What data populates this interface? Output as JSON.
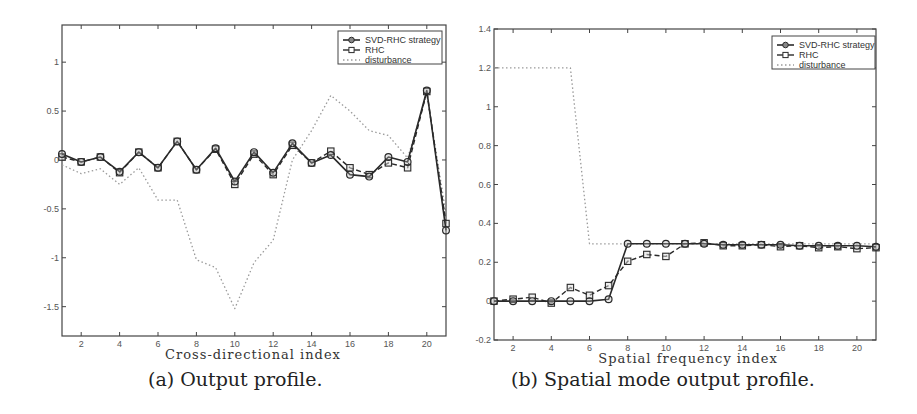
{
  "chart_data": [
    {
      "type": "line",
      "caption": "(a) Output profile.",
      "title": "",
      "xlabel": "Cross-directional index",
      "ylabel": "",
      "xlim": [
        1,
        21
      ],
      "ylim": [
        -1.8,
        1.38
      ],
      "xticks": [
        2,
        4,
        6,
        8,
        10,
        12,
        14,
        16,
        18,
        20
      ],
      "yticks": [
        -1.5,
        -1,
        -0.5,
        0,
        0.5,
        1
      ],
      "ytick_labels": [
        "-1.5",
        "-1",
        "-0.5",
        "0",
        "0.5",
        "1"
      ],
      "grid": false,
      "legend_position": "upper right",
      "x": [
        1,
        2,
        3,
        4,
        5,
        6,
        7,
        8,
        9,
        10,
        11,
        12,
        13,
        14,
        15,
        16,
        17,
        18,
        19,
        20,
        21
      ],
      "series": [
        {
          "name": "SVD-RHC strategy",
          "style": "solid-circle",
          "values": [
            0.06,
            -0.02,
            0.03,
            -0.12,
            0.08,
            -0.08,
            0.19,
            -0.1,
            0.12,
            -0.22,
            0.08,
            -0.13,
            0.17,
            -0.03,
            0.05,
            -0.15,
            -0.17,
            0.03,
            -0.02,
            0.71,
            -0.72
          ]
        },
        {
          "name": "RHC",
          "style": "dashed-square",
          "values": [
            0.03,
            -0.02,
            0.03,
            -0.13,
            0.08,
            -0.08,
            0.19,
            -0.1,
            0.11,
            -0.25,
            0.06,
            -0.15,
            0.15,
            -0.03,
            0.09,
            -0.08,
            -0.15,
            -0.03,
            -0.08,
            0.7,
            -0.65
          ]
        },
        {
          "name": "disturbance",
          "style": "dotted",
          "values": [
            -0.05,
            -0.14,
            -0.09,
            -0.25,
            -0.08,
            -0.41,
            -0.41,
            -1.02,
            -1.1,
            -1.52,
            -1.05,
            -0.82,
            0.0,
            0.3,
            0.66,
            0.5,
            0.3,
            0.25,
            0.02,
            0.67,
            -0.55
          ]
        }
      ]
    },
    {
      "type": "line",
      "caption": "(b) Spatial mode output profile.",
      "title": "",
      "xlabel": "Spatial frequency index",
      "ylabel": "",
      "xlim": [
        1,
        21
      ],
      "ylim": [
        -0.2,
        1.4
      ],
      "xticks": [
        2,
        4,
        6,
        8,
        10,
        12,
        14,
        16,
        18,
        20
      ],
      "yticks": [
        -0.2,
        0,
        0.2,
        0.4,
        0.6,
        0.8,
        1,
        1.2,
        1.4
      ],
      "ytick_labels": [
        "-0.2",
        "0",
        "0.2",
        "0.4",
        "0.6",
        "0.8",
        "1",
        "1.2",
        "1.4"
      ],
      "grid": false,
      "legend_position": "upper right",
      "x": [
        1,
        2,
        3,
        4,
        5,
        6,
        7,
        8,
        9,
        10,
        11,
        12,
        13,
        14,
        15,
        16,
        17,
        18,
        19,
        20,
        21
      ],
      "series": [
        {
          "name": "SVD-RHC strategy",
          "style": "solid-circle",
          "values": [
            0.0,
            0.0,
            0.0,
            0.0,
            0.0,
            0.0,
            0.01,
            0.295,
            0.295,
            0.295,
            0.295,
            0.295,
            0.29,
            0.29,
            0.29,
            0.29,
            0.285,
            0.285,
            0.285,
            0.285,
            0.28
          ]
        },
        {
          "name": "RHC",
          "style": "dashed-square",
          "values": [
            0.0,
            0.01,
            0.02,
            -0.01,
            0.07,
            0.03,
            0.08,
            0.205,
            0.24,
            0.23,
            0.295,
            0.3,
            0.285,
            0.285,
            0.29,
            0.28,
            0.285,
            0.275,
            0.28,
            0.27,
            0.275
          ]
        },
        {
          "name": "disturbance",
          "style": "dotted",
          "values": [
            1.2,
            1.2,
            1.2,
            1.2,
            1.2,
            0.295,
            0.295,
            0.295,
            0.295,
            0.295,
            0.295,
            0.295,
            0.295,
            0.295,
            0.295,
            0.295,
            0.295,
            0.295,
            0.295,
            0.295,
            0.295
          ]
        }
      ]
    }
  ],
  "legend": {
    "items": [
      "SVD-RHC strategy",
      "RHC",
      "disturbance"
    ]
  },
  "colors": {
    "svd_rhc": "#2a2a2a",
    "rhc": "#2a2a2a",
    "disturbance": "#9a9a9a",
    "axis": "#444444"
  }
}
